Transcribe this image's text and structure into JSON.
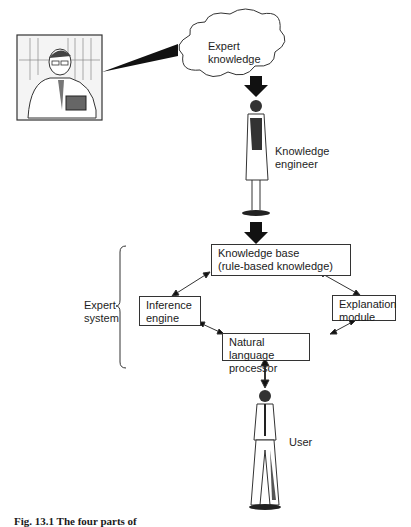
{
  "diagram": {
    "expert_portrait": {
      "description": "sketch of expert at desk with books"
    },
    "cloud": {
      "label_line1": "Expert",
      "label_line2": "knowledge"
    },
    "knowledge_engineer": {
      "label_line1": "Knowledge",
      "label_line2": "engineer"
    },
    "expert_system_brace": {
      "label_line1": "Expert",
      "label_line2": "system"
    },
    "boxes": {
      "knowledge_base": {
        "line1": "Knowledge base",
        "line2": "(rule-based knowledge)"
      },
      "inference_engine": {
        "line1": "Inference",
        "line2": "engine"
      },
      "explanation_module": {
        "line1": "Explanation",
        "line2": "module"
      },
      "nlp": {
        "line1": "Natural language",
        "line2": "processor"
      }
    },
    "user": {
      "label": "User"
    },
    "caption": "Fig. 13.1 The four parts of"
  },
  "colors": {
    "line": "#333333",
    "arrow_fill": "#111111",
    "background": "#ffffff"
  }
}
